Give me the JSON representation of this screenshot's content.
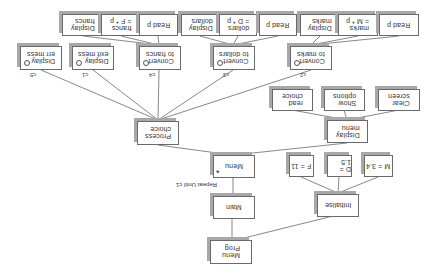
{
  "diagram": {
    "orientation": "rotated-180",
    "type": "structure chart (JSP)",
    "nodes": {
      "menu_prog": "Menu\nProg",
      "main": "Main",
      "initialise": "Initialise",
      "init_m": "M = 3.4",
      "init_d": "D = 1.5",
      "init_f": "F = 11",
      "menu": "Menu",
      "menu_iteration_marker": "*",
      "repeat_note": "Repeat Until c1",
      "display_menu": "Display\nmenu",
      "clear_screen": "Clear\nscreen",
      "show_options": "Show\noptions",
      "read_choice": "read\nchoice",
      "process_choice": "Process\nchoice",
      "convert_marks": "Convert\nto marks",
      "convert_dollars": "Convert\nto dollars",
      "convert_francs": "Convert\nto francs",
      "display_exit_mess": "Display\nexit mess",
      "display_err_mess": "Display\nerr mess",
      "marks_read_p": "Read p",
      "marks_calc": "marks\n= M * p",
      "marks_display": "Display\nmarks",
      "dollars_read_p": "Read p",
      "dollars_calc": "dollars\n= D * p",
      "dollars_display": "Display\ndollars",
      "francs_read_p": "Read p",
      "francs_calc": "francs\n= F * p",
      "francs_display": "Display\nfrancs"
    },
    "conditions": {
      "c2": "c2",
      "c3": "c3",
      "c4": "c4",
      "c1": "c1",
      "c5": "c5"
    }
  }
}
